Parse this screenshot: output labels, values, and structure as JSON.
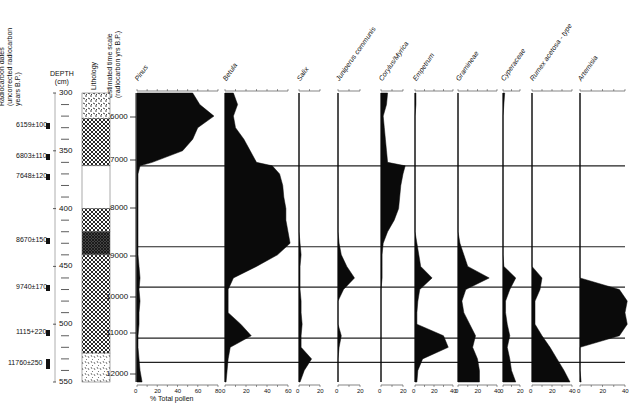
{
  "headers": {
    "radiocarbon": [
      "Radiocarbon dates",
      "(uncorrected radiocarbon",
      "years B.P.)"
    ],
    "depth": [
      "DEPTH",
      "(cm)"
    ],
    "lithology": "Lithology",
    "timescale": [
      "Estimated time scale",
      "(radiocarbon yrs B.P.)"
    ]
  },
  "xaxis_title": "% Total pollen",
  "radiocarbon_dates": [
    {
      "label": "6159±100",
      "y": 126
    },
    {
      "label": "6803±110",
      "y": 157
    },
    {
      "label": "7648±120",
      "y": 177
    },
    {
      "label": "8670±150",
      "y": 241
    },
    {
      "label": "9740±170",
      "y": 288
    },
    {
      "label": "1115+220",
      "y": 333
    },
    {
      "label": "11760±250",
      "y": 364
    }
  ],
  "depth_ticks": [
    {
      "label": "300",
      "y": 93
    },
    {
      "label": "350",
      "y": 151
    },
    {
      "label": "400",
      "y": 209
    },
    {
      "label": "450",
      "y": 266
    },
    {
      "label": "500",
      "y": 324
    },
    {
      "label": "550",
      "y": 382
    }
  ],
  "time_ticks": [
    {
      "label": "6000",
      "y": 117
    },
    {
      "label": "7000",
      "y": 160
    },
    {
      "label": "8000",
      "y": 208
    },
    {
      "label": "9000",
      "y": 256
    },
    {
      "label": "10000",
      "y": 297
    },
    {
      "label": "11000",
      "y": 333
    },
    {
      "label": "12000",
      "y": 374
    }
  ],
  "chart_data": {
    "type": "area",
    "xlabel": "% Total pollen",
    "ylabel": "DEPTH (cm)",
    "ylim": [
      300,
      550
    ],
    "secondary_ylabel": "Estimated time scale (radiocarbon yrs B.P.)",
    "time_ticks": [
      6000,
      7000,
      8000,
      9000,
      10000,
      11000,
      12000
    ],
    "depth_ticks": [
      300,
      350,
      400,
      450,
      500,
      550
    ],
    "radiocarbon_dates": [
      "6159±100",
      "6803±110",
      "7648±120",
      "8670±150",
      "9740±170",
      "1115+220",
      "11760±250"
    ],
    "zone_boundaries_depth_cm": [
      363,
      433,
      468,
      512,
      533
    ],
    "depth_samples_cm": [
      300,
      310,
      320,
      330,
      340,
      350,
      360,
      363,
      370,
      380,
      390,
      400,
      410,
      420,
      430,
      440,
      450,
      460,
      470,
      480,
      490,
      500,
      510,
      520,
      530,
      540,
      550
    ],
    "series": [
      {
        "name": "Pinus",
        "xlim": [
          0,
          80
        ],
        "ticks": [
          0,
          20,
          40,
          60,
          80
        ],
        "values": [
          55,
          62,
          76,
          60,
          55,
          45,
          15,
          3,
          1,
          1,
          1,
          1,
          1,
          1,
          1,
          1,
          2,
          3,
          2,
          3,
          2,
          2,
          1,
          1,
          2,
          3,
          5
        ]
      },
      {
        "name": "Betula",
        "xlim": [
          0,
          60
        ],
        "ticks": [
          0,
          20,
          40,
          60
        ],
        "values": [
          8,
          12,
          8,
          10,
          18,
          24,
          30,
          45,
          52,
          55,
          56,
          58,
          58,
          60,
          62,
          50,
          30,
          8,
          3,
          3,
          3,
          15,
          25,
          5,
          3,
          2,
          1
        ]
      },
      {
        "name": "Salix",
        "xlim": [
          0,
          20
        ],
        "ticks": [
          0,
          20
        ],
        "values": [
          0,
          0,
          0,
          0,
          0,
          0,
          0,
          0,
          0,
          0,
          0,
          0,
          0,
          0,
          1,
          2,
          1,
          1,
          1,
          2,
          2,
          3,
          2,
          2,
          12,
          5,
          1
        ]
      },
      {
        "name": "Juniperus communis",
        "xlim": [
          0,
          20
        ],
        "ticks": [
          0,
          20
        ],
        "values": [
          0,
          0,
          0,
          0,
          0,
          0,
          0,
          0,
          0,
          0,
          0,
          0,
          0,
          0,
          1,
          3,
          8,
          15,
          5,
          0,
          0,
          0,
          3,
          1,
          0,
          0,
          0
        ]
      },
      {
        "name": "Corylus/Myrica",
        "xlim": [
          0,
          20
        ],
        "ticks": [
          0,
          20
        ],
        "values": [
          6,
          5,
          2,
          3,
          4,
          5,
          6,
          22,
          20,
          18,
          17,
          16,
          12,
          6,
          2,
          1,
          1,
          1,
          0,
          0,
          0,
          0,
          0,
          0,
          0,
          0,
          0
        ]
      },
      {
        "name": "Empetrum",
        "xlim": [
          0,
          40
        ],
        "ticks": [
          0,
          20,
          40
        ],
        "values": [
          1,
          1,
          0,
          0,
          0,
          0,
          0,
          0,
          0,
          0,
          0,
          0,
          0,
          0,
          2,
          4,
          6,
          18,
          5,
          3,
          2,
          2,
          30,
          35,
          8,
          3,
          2
        ]
      },
      {
        "name": "Gramineae",
        "xlim": [
          0,
          40
        ],
        "ticks": [
          0,
          20,
          40
        ],
        "values": [
          0,
          0,
          0,
          0,
          0,
          0,
          0,
          0,
          0,
          0,
          0,
          0,
          0,
          0,
          2,
          6,
          10,
          32,
          8,
          4,
          6,
          12,
          18,
          15,
          20,
          22,
          22
        ]
      },
      {
        "name": "Cyperaceae",
        "xlim": [
          0,
          20
        ],
        "ticks": [
          0,
          20
        ],
        "values": [
          2,
          1,
          0,
          0,
          0,
          0,
          0,
          0,
          0,
          0,
          0,
          0,
          0,
          0,
          0,
          0,
          1,
          15,
          8,
          3,
          3,
          5,
          8,
          5,
          8,
          10,
          15
        ]
      },
      {
        "name": "Rumex acetosa - type",
        "xlim": [
          0,
          40
        ],
        "ticks": [
          0,
          20,
          40
        ],
        "values": [
          0,
          0,
          0,
          0,
          0,
          0,
          0,
          0,
          0,
          0,
          0,
          0,
          0,
          0,
          0,
          0,
          0,
          10,
          8,
          3,
          3,
          3,
          10,
          18,
          25,
          32,
          38
        ]
      },
      {
        "name": "Artemisia",
        "xlim": [
          0,
          40
        ],
        "ticks": [
          0,
          20,
          40
        ],
        "values": [
          0,
          0,
          0,
          0,
          0,
          0,
          0,
          0,
          0,
          0,
          0,
          0,
          0,
          0,
          0,
          0,
          0,
          0,
          35,
          42,
          40,
          42,
          35,
          0,
          0,
          0,
          1
        ]
      }
    ],
    "grid": false,
    "legend": "none"
  }
}
